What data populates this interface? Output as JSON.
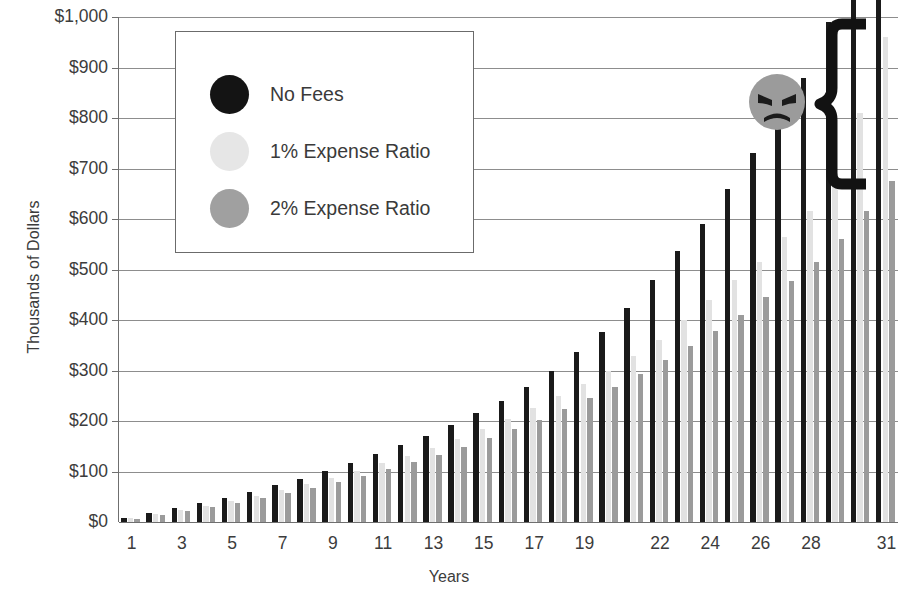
{
  "chart_data": {
    "type": "bar",
    "title": "",
    "xlabel": "Years",
    "ylabel": "Thousands of Dollars",
    "ylim": [
      0,
      1000
    ],
    "ytick_values": [
      0,
      100,
      200,
      300,
      400,
      500,
      600,
      700,
      800,
      900,
      1000
    ],
    "ytick_labels": [
      "$0",
      "$100",
      "$200",
      "$300",
      "$400",
      "$500",
      "$600",
      "$700",
      "$800",
      "$900",
      "$1,000"
    ],
    "grid": true,
    "legend_position": "upper-left-inset",
    "categories": [
      1,
      2,
      3,
      4,
      5,
      6,
      7,
      8,
      9,
      10,
      11,
      12,
      13,
      14,
      15,
      16,
      17,
      18,
      19,
      20,
      21,
      22,
      23,
      24,
      25,
      26,
      27,
      28,
      29,
      30,
      31
    ],
    "xtick_labels": [
      "1",
      "3",
      "5",
      "7",
      "9",
      "11",
      "13",
      "15",
      "17",
      "19",
      "22",
      "24",
      "26",
      "28",
      "31"
    ],
    "xtick_categories": [
      1,
      3,
      5,
      7,
      9,
      11,
      13,
      15,
      17,
      19,
      22,
      24,
      26,
      28,
      31
    ],
    "series": [
      {
        "name": "No Fees",
        "color": "#1a1a1a",
        "values": [
          11,
          23,
          36,
          50,
          65,
          81,
          98,
          117,
          137,
          159,
          182,
          207,
          234,
          263,
          294,
          327,
          363,
          401,
          442,
          486,
          533,
          583,
          637,
          695,
          757,
          823,
          894,
          970,
          1051,
          1138,
          1231
        ]
      },
      {
        "name": "1% Expense Ratio",
        "color": "#e2e2e2",
        "values": [
          10,
          22,
          34,
          47,
          61,
          76,
          91,
          108,
          126,
          145,
          165,
          186,
          209,
          233,
          259,
          286,
          315,
          346,
          378,
          413,
          450,
          489,
          530,
          574,
          620,
          669,
          721,
          776,
          834,
          896,
          961
        ]
      },
      {
        "name": "2% Expense Ratio",
        "color": "#9b9b9b",
        "values": [
          10,
          21,
          32,
          44,
          57,
          70,
          84,
          99,
          114,
          131,
          148,
          166,
          186,
          206,
          228,
          250,
          274,
          299,
          326,
          354,
          383,
          414,
          446,
          480,
          516,
          554,
          593,
          635,
          678,
          724,
          773
        ]
      }
    ],
    "rendered_values": {
      "No Fees": [
        8,
        17,
        27,
        37,
        48,
        60,
        73,
        86,
        101,
        117,
        134,
        152,
        171,
        192,
        215,
        240,
        268,
        300,
        336,
        377,
        424,
        480,
        537,
        590,
        660,
        730,
        810,
        880,
        990
      ],
      "1% Expense Ratio": [
        7,
        15,
        23,
        32,
        42,
        52,
        63,
        75,
        88,
        101,
        116,
        131,
        147,
        165,
        184,
        204,
        226,
        249,
        273,
        300,
        328,
        360,
        400,
        440,
        480,
        515,
        565,
        615,
        680,
        810
      ],
      "2% Expense Ratio": [
        6,
        13,
        21,
        29,
        38,
        47,
        57,
        67,
        79,
        91,
        104,
        118,
        133,
        149,
        166,
        184,
        203,
        224,
        245,
        268,
        293,
        320,
        348,
        378,
        410,
        445,
        478,
        515,
        560,
        615,
        675
      ]
    },
    "annotations": [
      {
        "name": "angry-face",
        "type": "emoji",
        "description": "angry gray face"
      },
      {
        "name": "fee-gap-brace",
        "type": "brace",
        "description": "curly brace spanning the gap between No Fees and fee bars"
      }
    ]
  },
  "legend": {
    "items": [
      {
        "label": "No Fees",
        "color": "#141414"
      },
      {
        "label": "1% Expense Ratio",
        "color": "#e6e6e6"
      },
      {
        "label": "2% Expense Ratio",
        "color": "#a0a0a0"
      }
    ]
  },
  "axes": {
    "y_title": "Thousands of Dollars",
    "x_title": "Years"
  }
}
